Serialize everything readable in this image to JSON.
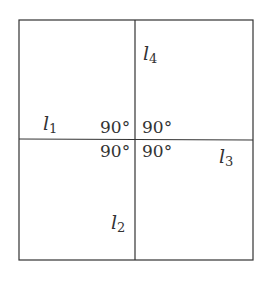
{
  "diagram": {
    "line_color": "#333333",
    "text_color": "#333333",
    "lines": {
      "l1": {
        "name": "l",
        "sub": "1"
      },
      "l2": {
        "name": "l",
        "sub": "2"
      },
      "l3": {
        "name": "l",
        "sub": "3"
      },
      "l4": {
        "name": "l",
        "sub": "4"
      }
    },
    "angles": {
      "top_left": "90°",
      "top_right": "90°",
      "bottom_left": "90°",
      "bottom_right": "90°"
    }
  }
}
